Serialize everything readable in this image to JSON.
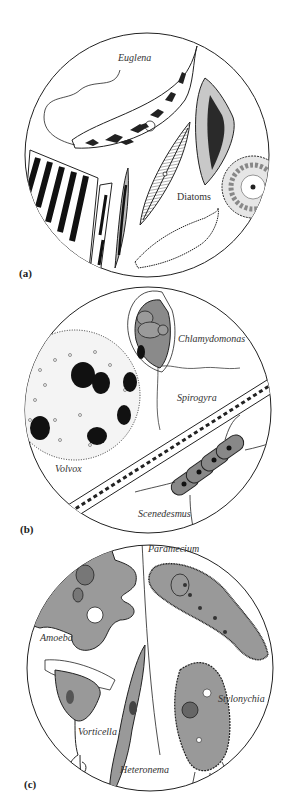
{
  "figure": {
    "panels": [
      {
        "id": "a",
        "label": "(a)",
        "organisms": [
          {
            "name": "Euglena"
          },
          {
            "name": "Diatoms"
          }
        ]
      },
      {
        "id": "b",
        "label": "(b)",
        "organisms": [
          {
            "name": "Chlamydomonas"
          },
          {
            "name": "Spirogyra"
          },
          {
            "name": "Volvox"
          },
          {
            "name": "Scenedesmus"
          }
        ]
      },
      {
        "id": "c",
        "label": "(c)",
        "organisms": [
          {
            "name": "Paramecium"
          },
          {
            "name": "Amoeba"
          },
          {
            "name": "Stylonychia"
          },
          {
            "name": "Vorticella"
          },
          {
            "name": "Heteronema"
          }
        ]
      }
    ]
  },
  "colors": {
    "outline": "#222222",
    "cell_fill": "#8a8a8a",
    "light_fill": "#c8c8c8",
    "dark_fill": "#1a1a1a",
    "background": "#ffffff"
  }
}
